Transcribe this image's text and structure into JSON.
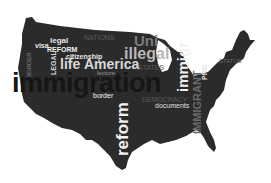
{
  "image": {
    "description": "Word cloud in the shape of the United States map",
    "colors": {
      "map_fill": "#2b2b2b",
      "bright_text": "#f2f2f2",
      "mid_text": "#b8b8b8",
      "dim_text": "#5a5a5a",
      "dark_text": "#161616",
      "background": "#ffffff"
    }
  },
  "words": {
    "immigration": "immigration",
    "reform_big": "reform",
    "america": "America",
    "illegal": "illegal",
    "life": "life",
    "immigr": "immigr",
    "legal_h": "legal",
    "visa": "visa",
    "reform_caps": "REFORM",
    "citizenship": "citizenship",
    "legal_v": "LEGAL",
    "border_v": "BORDER",
    "border": "border",
    "lecture": "lecture",
    "documents": "documents",
    "democracy": "DEMOCRACY",
    "nations": "NATIONS",
    "states": "STATES",
    "united": "Uni",
    "immigrant_v": "IMMIGRANT",
    "pro_v": "PRO",
    "statue": "STATUE"
  }
}
